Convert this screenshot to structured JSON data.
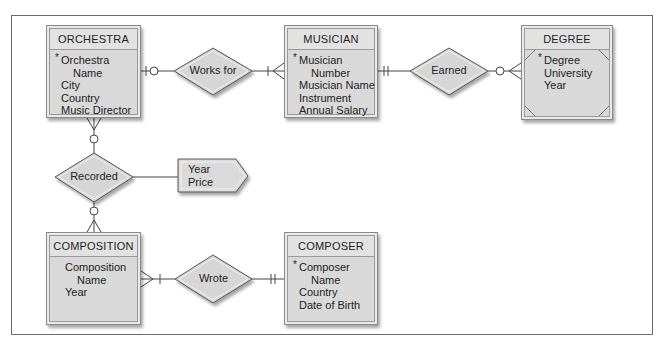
{
  "diagram": {
    "type": "entity-relationship",
    "entities": [
      {
        "id": "orchestra",
        "name": "ORCHESTRA",
        "weak": false,
        "attributes": [
          {
            "text": "Orchestra",
            "key": true
          },
          {
            "text": "Name",
            "continuation": true
          },
          {
            "text": "City"
          },
          {
            "text": "Country"
          },
          {
            "text": "Music Director"
          }
        ]
      },
      {
        "id": "musician",
        "name": "MUSICIAN",
        "weak": false,
        "attributes": [
          {
            "text": "Musician",
            "key": true
          },
          {
            "text": "Number",
            "continuation": true
          },
          {
            "text": "Musician Name"
          },
          {
            "text": "Instrument"
          },
          {
            "text": "Annual Salary"
          }
        ]
      },
      {
        "id": "degree",
        "name": "DEGREE",
        "weak": true,
        "attributes": [
          {
            "text": "Degree",
            "key": true
          },
          {
            "text": "University"
          },
          {
            "text": "Year"
          }
        ]
      },
      {
        "id": "composition",
        "name": "COMPOSITION",
        "weak": false,
        "attributes": [
          {
            "text": "Composition"
          },
          {
            "text": "Name",
            "continuation": true
          },
          {
            "text": "Year"
          }
        ]
      },
      {
        "id": "composer",
        "name": "COMPOSER",
        "weak": false,
        "attributes": [
          {
            "text": "Composer",
            "key": true
          },
          {
            "text": "Name",
            "continuation": true
          },
          {
            "text": "Country"
          },
          {
            "text": "Date of Birth"
          }
        ]
      }
    ],
    "relationships": [
      {
        "id": "works_for",
        "label": "Works for",
        "from": "orchestra",
        "to": "musician",
        "from_cardinality": "zero-or-one",
        "to_cardinality": "one-or-many"
      },
      {
        "id": "earned",
        "label": "Earned",
        "from": "musician",
        "to": "degree",
        "from_cardinality": "exactly-one",
        "to_cardinality": "zero-or-many"
      },
      {
        "id": "recorded",
        "label": "Recorded",
        "from": "orchestra",
        "to": "composition",
        "from_cardinality": "zero-or-many",
        "to_cardinality": "zero-or-many"
      },
      {
        "id": "wrote",
        "label": "Wrote",
        "from": "composition",
        "to": "composer",
        "from_cardinality": "one-or-many",
        "to_cardinality": "exactly-one"
      }
    ],
    "relationship_attributes": {
      "relationship": "recorded",
      "attributes": [
        "Year",
        "Price"
      ]
    },
    "key_marker": "*",
    "colors": {
      "entity_fill": "#d9d9d9",
      "entity_header": "#e2e2e2",
      "line": "#444444",
      "frame": "#6a6a6a"
    }
  }
}
